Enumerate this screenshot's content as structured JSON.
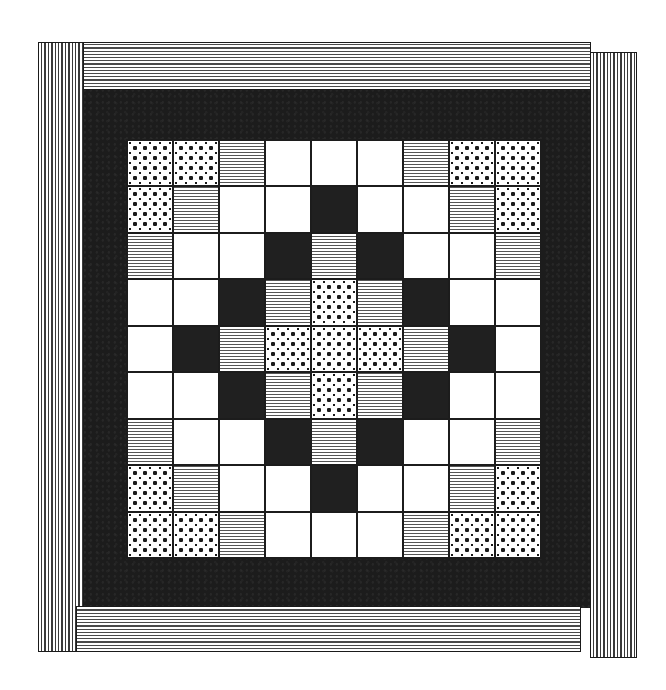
{
  "palette": {
    "background": "#ffffff",
    "dark_field": "#1c1c1c",
    "black_cell": "#202020",
    "white_cell": "#ffffff",
    "stripe_ink": "#4a4a4a",
    "dot_ink": "#1a1a1a"
  },
  "legend": {
    "W": "plain white square",
    "B": "solid black square",
    "S": "horizontal-striped square",
    "D": "polka-dot square"
  },
  "borders": {
    "left": "vertical-stripe",
    "right": "vertical-stripe",
    "top": "horizontal-stripe",
    "bottom": "horizontal-stripe"
  },
  "grid": {
    "rows": 9,
    "cols": 9,
    "cells": [
      [
        "D",
        "D",
        "S",
        "W",
        "W",
        "W",
        "S",
        "D",
        "D"
      ],
      [
        "D",
        "S",
        "W",
        "W",
        "B",
        "W",
        "W",
        "S",
        "D"
      ],
      [
        "S",
        "W",
        "W",
        "B",
        "S",
        "B",
        "W",
        "W",
        "S"
      ],
      [
        "W",
        "W",
        "B",
        "S",
        "D",
        "S",
        "B",
        "W",
        "W"
      ],
      [
        "W",
        "B",
        "S",
        "D",
        "D",
        "D",
        "S",
        "B",
        "W"
      ],
      [
        "W",
        "W",
        "B",
        "S",
        "D",
        "S",
        "B",
        "W",
        "W"
      ],
      [
        "S",
        "W",
        "W",
        "B",
        "S",
        "B",
        "W",
        "W",
        "S"
      ],
      [
        "D",
        "S",
        "W",
        "W",
        "B",
        "W",
        "W",
        "S",
        "D"
      ],
      [
        "D",
        "D",
        "S",
        "W",
        "W",
        "W",
        "S",
        "D",
        "D"
      ]
    ]
  }
}
